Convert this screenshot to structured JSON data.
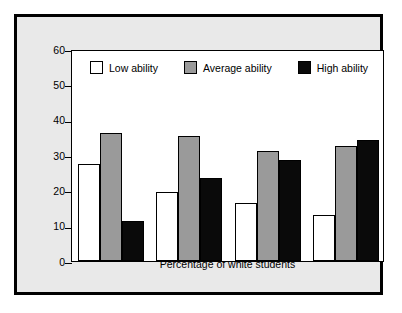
{
  "chart_data": {
    "type": "bar",
    "title": "",
    "xlabel": "Percentage of white students",
    "ylabel": "Percentage of homogeneous ability classes",
    "categories": [
      "0–10",
      "10–50",
      "50–90",
      "90–100"
    ],
    "series": [
      {
        "name": "Low ability",
        "values": [
          27.5,
          19.5,
          16.5,
          13.0
        ],
        "color": "#ffffff"
      },
      {
        "name": "Average ability",
        "values": [
          36.3,
          35.4,
          31.2,
          32.5
        ],
        "color": "#9a9a9a"
      },
      {
        "name": "High ability",
        "values": [
          11.3,
          23.5,
          28.6,
          34.2
        ],
        "color": "#0a0a0a"
      }
    ],
    "ylim": [
      0,
      60
    ],
    "yticks": [
      0,
      10,
      20,
      30,
      40,
      50,
      60
    ],
    "ytick_labels": [
      "0",
      "10",
      "20",
      "30",
      "40",
      "50",
      "60"
    ],
    "grid": false,
    "legend_position": "top-inside-left",
    "legend_entries": [
      "Low ability",
      "Average ability",
      "High ability"
    ]
  },
  "figure": {
    "background_color": "#e9e9e9",
    "plot_background_color": "#ffffff",
    "border_color": "#000000"
  }
}
